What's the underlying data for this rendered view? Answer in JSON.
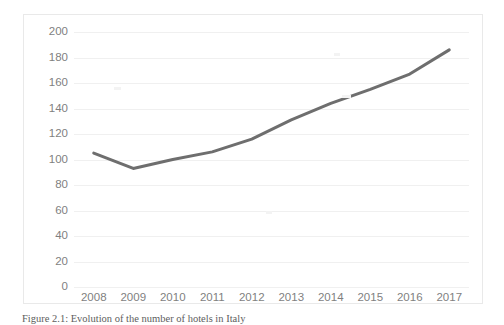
{
  "figure": {
    "caption": "Figure 2.1: Evolution of the number of hotels in Italy"
  },
  "chart_data": {
    "type": "line",
    "title": "",
    "xlabel": "",
    "ylabel": "",
    "categories": [
      "2008",
      "2009",
      "2010",
      "2011",
      "2012",
      "2013",
      "2014",
      "2015",
      "2016",
      "2017"
    ],
    "values": [
      105,
      93,
      100,
      106,
      116,
      131,
      144,
      155,
      167,
      186
    ],
    "series": [
      {
        "name": "Number of hotels",
        "values": [
          105,
          93,
          100,
          106,
          116,
          131,
          144,
          155,
          167,
          186
        ]
      }
    ],
    "ylim": [
      0,
      200
    ],
    "y_ticks": [
      0,
      20,
      40,
      60,
      80,
      100,
      120,
      140,
      160,
      180,
      200
    ],
    "y_tick_labels": [
      "0",
      "20",
      "40",
      "60",
      "80",
      "100",
      "120",
      "140",
      "160",
      "180",
      "200"
    ],
    "grid": "horizontal",
    "legend": "none",
    "line_color": "#6e6e6e",
    "gridline_color": "#f0f0f0",
    "tick_label_color": "#7f7f7f",
    "border_color": "#e9e9e9",
    "background": "#ffffff"
  }
}
